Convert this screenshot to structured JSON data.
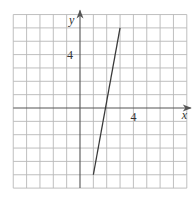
{
  "chart_data": {
    "type": "line",
    "title": "",
    "xlabel": "x",
    "ylabel": "y",
    "xlim": [
      -5,
      8
    ],
    "ylim": [
      -6,
      7
    ],
    "grid": true,
    "grid_step": 1,
    "x_tick_labels": [
      {
        "value": 4,
        "label": "4"
      }
    ],
    "y_tick_labels": [
      {
        "value": 4,
        "label": "4"
      }
    ],
    "series": [
      {
        "name": "line segment",
        "x": [
          1,
          3
        ],
        "y": [
          -5,
          6
        ]
      }
    ],
    "colors": {
      "grid": "#b8b8b8",
      "axis": "#555555",
      "line": "#3a3a3a"
    }
  }
}
